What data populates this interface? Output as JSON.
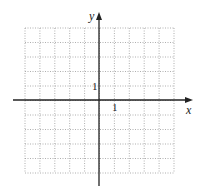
{
  "chart_data": {
    "type": "scatter",
    "title": "",
    "xlabel": "x",
    "ylabel": "y",
    "xlim": [
      -5,
      5
    ],
    "ylim": [
      -5,
      5
    ],
    "grid": true,
    "grid_style": "dotted",
    "tick_labels": {
      "x": [
        "1"
      ],
      "y": [
        "1"
      ]
    },
    "series": [],
    "annotations": []
  },
  "labels": {
    "x_axis": "x",
    "y_axis": "y",
    "x_tick_1": "1",
    "y_tick_1": "1"
  },
  "colors": {
    "axis": "#222222",
    "grid": "#9a9a9a",
    "background": "#ffffff"
  }
}
